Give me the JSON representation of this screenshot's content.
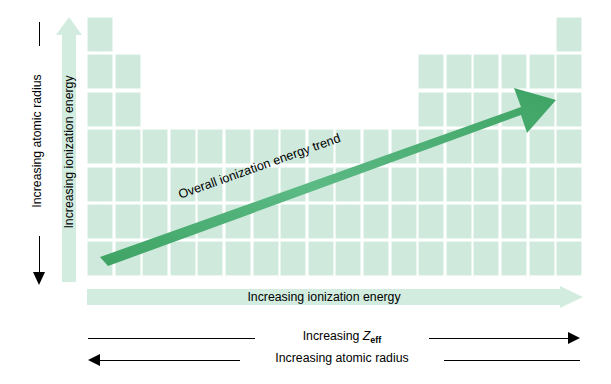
{
  "diagram": {
    "colors": {
      "cell_fill": "#cfe9dc",
      "pale_arrow": "#d2ecdf",
      "trend_arrow_light": "#6fc391",
      "trend_arrow_dark": "#3da363",
      "line_black": "#000000"
    }
  },
  "labels": {
    "vertical_atomic_radius": "Increasing atomic radius",
    "vertical_ionization_energy": "Increasing ionization energy",
    "diagonal_trend": "Overall ionization energy trend",
    "horizontal_ionization_energy": "Increasing ionization energy",
    "horizontal_zeff_prefix": "Increasing ",
    "horizontal_zeff_symbol": "Z",
    "horizontal_zeff_subscript": "eff",
    "horizontal_atomic_radius": "Increasing atomic radius"
  },
  "periodic_table": {
    "columns": 18,
    "rows": 7,
    "cell_width": 26,
    "cell_height": 35,
    "gap_x": 1.6,
    "gap_y": 2.4,
    "row_layout": [
      {
        "row": 1,
        "groups": [
          1,
          18
        ]
      },
      {
        "row": 2,
        "groups": [
          1,
          2,
          13,
          14,
          15,
          16,
          17,
          18
        ]
      },
      {
        "row": 3,
        "groups": [
          1,
          2,
          13,
          14,
          15,
          16,
          17,
          18
        ]
      },
      {
        "row": 4,
        "groups": [
          1,
          2,
          3,
          4,
          5,
          6,
          7,
          8,
          9,
          10,
          11,
          12,
          13,
          14,
          15,
          16,
          17,
          18
        ]
      },
      {
        "row": 5,
        "groups": [
          1,
          2,
          3,
          4,
          5,
          6,
          7,
          8,
          9,
          10,
          11,
          12,
          13,
          14,
          15,
          16,
          17,
          18
        ]
      },
      {
        "row": 6,
        "groups": [
          1,
          2,
          3,
          4,
          5,
          6,
          7,
          8,
          9,
          10,
          11,
          12,
          13,
          14,
          15,
          16,
          17,
          18
        ]
      },
      {
        "row": 7,
        "groups": [
          1,
          2,
          3,
          4,
          5,
          6,
          7,
          8,
          9,
          10,
          11,
          12,
          13,
          14,
          15,
          16,
          17,
          18
        ]
      }
    ]
  },
  "arrows": {
    "vertical_atomic_radius_direction": "down",
    "vertical_ionization_energy_direction": "up",
    "diagonal_trend_direction": "up-right",
    "horizontal_ionization_energy_direction": "right",
    "horizontal_zeff_direction": "right",
    "horizontal_atomic_radius_direction": "left"
  }
}
